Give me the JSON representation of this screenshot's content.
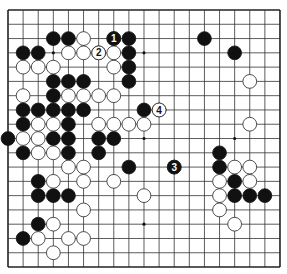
{
  "board": {
    "size": 19,
    "origin": {
      "x": 8,
      "y": 10
    },
    "spacing": {
      "x": 15.11,
      "y": 14.28
    },
    "stone_radius": 6.9,
    "colors": {
      "line": "#333333",
      "edge": "#222222",
      "black": "#111111",
      "white": "#ffffff",
      "stroke": "#222222",
      "star": "#111111"
    },
    "star_points": [
      [
        3,
        3
      ],
      [
        9,
        3
      ],
      [
        15,
        3
      ],
      [
        3,
        9
      ],
      [
        9,
        9
      ],
      [
        15,
        9
      ],
      [
        3,
        15
      ],
      [
        9,
        15
      ],
      [
        15,
        15
      ]
    ]
  },
  "stones": {
    "black": [
      [
        3,
        2
      ],
      [
        4,
        2
      ],
      [
        7,
        2
      ],
      [
        8,
        2
      ],
      [
        13,
        2
      ],
      [
        1,
        3
      ],
      [
        2,
        3
      ],
      [
        8,
        3
      ],
      [
        15,
        3
      ],
      [
        8,
        4
      ],
      [
        3,
        5
      ],
      [
        4,
        5
      ],
      [
        5,
        5
      ],
      [
        8,
        5
      ],
      [
        3,
        6
      ],
      [
        1,
        7
      ],
      [
        2,
        7
      ],
      [
        3,
        7
      ],
      [
        4,
        7
      ],
      [
        5,
        7
      ],
      [
        9,
        7
      ],
      [
        1,
        8
      ],
      [
        4,
        8
      ],
      [
        0,
        9
      ],
      [
        3,
        9
      ],
      [
        4,
        9
      ],
      [
        6,
        9
      ],
      [
        7,
        9
      ],
      [
        1,
        10
      ],
      [
        4,
        10
      ],
      [
        6,
        10
      ],
      [
        14,
        10
      ],
      [
        8,
        11
      ],
      [
        11,
        11
      ],
      [
        14,
        11
      ],
      [
        2,
        12
      ],
      [
        15,
        12
      ],
      [
        2,
        13
      ],
      [
        3,
        13
      ],
      [
        4,
        13
      ],
      [
        15,
        13
      ],
      [
        16,
        13
      ],
      [
        17,
        13
      ],
      [
        2,
        15
      ],
      [
        1,
        16
      ]
    ],
    "white": [
      [
        5,
        2
      ],
      [
        4,
        3
      ],
      [
        5,
        3
      ],
      [
        6,
        3
      ],
      [
        7,
        3
      ],
      [
        1,
        4
      ],
      [
        2,
        4
      ],
      [
        3,
        4
      ],
      [
        7,
        4
      ],
      [
        16,
        5
      ],
      [
        1,
        6
      ],
      [
        4,
        6
      ],
      [
        5,
        6
      ],
      [
        6,
        6
      ],
      [
        7,
        6
      ],
      [
        10,
        7
      ],
      [
        2,
        8
      ],
      [
        3,
        8
      ],
      [
        6,
        8
      ],
      [
        7,
        8
      ],
      [
        8,
        8
      ],
      [
        9,
        8
      ],
      [
        16,
        8
      ],
      [
        1,
        9
      ],
      [
        2,
        9
      ],
      [
        2,
        10
      ],
      [
        3,
        10
      ],
      [
        4,
        11
      ],
      [
        5,
        11
      ],
      [
        15,
        11
      ],
      [
        16,
        11
      ],
      [
        3,
        12
      ],
      [
        5,
        12
      ],
      [
        7,
        12
      ],
      [
        14,
        12
      ],
      [
        16,
        12
      ],
      [
        9,
        13
      ],
      [
        14,
        13
      ],
      [
        5,
        14
      ],
      [
        14,
        14
      ],
      [
        3,
        15
      ],
      [
        15,
        15
      ],
      [
        2,
        16
      ],
      [
        4,
        16
      ],
      [
        5,
        16
      ],
      [
        3,
        17
      ]
    ]
  },
  "move_labels": [
    {
      "number": "1",
      "color": "black",
      "col": 7,
      "row": 2
    },
    {
      "number": "2",
      "color": "white",
      "col": 6,
      "row": 3
    },
    {
      "number": "3",
      "color": "black",
      "col": 11,
      "row": 11
    },
    {
      "number": "4",
      "color": "white",
      "col": 10,
      "row": 7
    }
  ]
}
